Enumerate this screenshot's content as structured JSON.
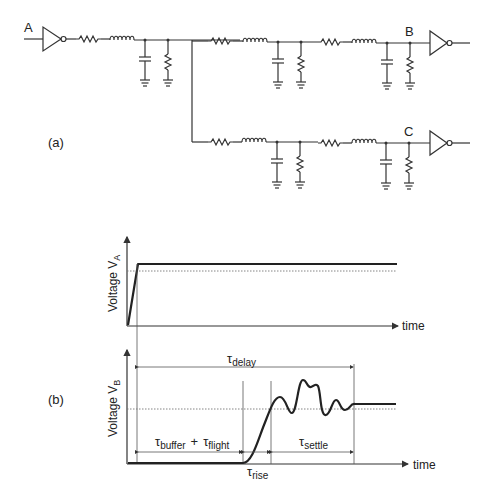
{
  "circuit": {
    "node_labels": {
      "input": "A",
      "output_top": "B",
      "output_bottom": "C"
    },
    "panel_label": "(a)",
    "components": {
      "driver": "inverter-buffer",
      "receivers": [
        "inverter-buffer",
        "inverter-buffer"
      ],
      "segment_elements": [
        "resistor",
        "inductor",
        "capacitor-to-ground",
        "resistor-to-ground"
      ]
    }
  },
  "waveforms": {
    "panel_label": "(b)",
    "top": {
      "ylabel_main": "Voltage V",
      "ylabel_sub": "A",
      "xlabel": "time"
    },
    "bottom": {
      "ylabel_main": "Voltage V",
      "ylabel_sub": "B",
      "xlabel": "time",
      "annotations": {
        "delay": {
          "tau": "τ",
          "sub": "delay"
        },
        "buffer": {
          "tau": "τ",
          "sub": "buffer"
        },
        "plus": "+",
        "flight": {
          "tau": "τ",
          "sub": "flight"
        },
        "rise": {
          "tau": "τ",
          "sub": "rise"
        },
        "settle": {
          "tau": "τ",
          "sub": "settle"
        }
      }
    }
  }
}
